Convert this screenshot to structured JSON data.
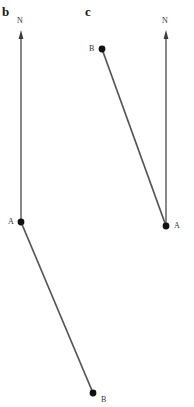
{
  "figure": {
    "type": "diagram",
    "width": 194,
    "height": 407,
    "background_color": "#ffffff",
    "stroke_color": "#6b6b6b",
    "segment_color": "#555555",
    "marker_color": "#1a1a1a"
  },
  "panels": [
    {
      "id": "b",
      "label": "b",
      "north_arrow": {
        "label": "N",
        "label_x": 17,
        "label_y": 17,
        "x": 21,
        "tip_y": 31,
        "tail_y": 222
      },
      "points": [
        {
          "name": "A",
          "label": "A",
          "x": 21,
          "y": 222,
          "label_x": 8,
          "label_y": 218
        },
        {
          "name": "B",
          "label": "B",
          "x": 93,
          "y": 393,
          "label_x": 101,
          "label_y": 396
        }
      ],
      "segments": [
        {
          "from": "A",
          "to": "B",
          "x1": 21,
          "y1": 222,
          "x2": 93,
          "y2": 393
        }
      ]
    },
    {
      "id": "c",
      "label": "c",
      "north_arrow": {
        "label": "N",
        "label_x": 162,
        "label_y": 17,
        "x": 166,
        "tip_y": 31,
        "tail_y": 226
      },
      "points": [
        {
          "name": "B",
          "label": "B",
          "x": 102,
          "y": 49,
          "label_x": 89,
          "label_y": 45
        },
        {
          "name": "A",
          "label": "A",
          "x": 166,
          "y": 226,
          "label_x": 174,
          "label_y": 222
        }
      ],
      "segments": [
        {
          "from": "B",
          "to": "A",
          "x1": 102,
          "y1": 49,
          "x2": 166,
          "y2": 226
        }
      ]
    }
  ]
}
